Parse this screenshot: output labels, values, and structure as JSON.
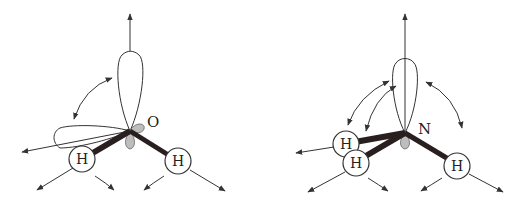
{
  "diagram": {
    "molecules": [
      {
        "name": "water",
        "center_atom": {
          "label": "O"
        },
        "hydrogens": [
          {
            "label": "H"
          },
          {
            "label": "H"
          }
        ],
        "lone_pairs": 2
      },
      {
        "name": "ammonia",
        "center_atom": {
          "label": "N"
        },
        "hydrogens": [
          {
            "label": "H"
          },
          {
            "label": "H"
          },
          {
            "label": "H"
          }
        ],
        "lone_pairs": 1
      }
    ],
    "colors": {
      "line": "#333333",
      "bond": "#2a1f1f",
      "lobe_fill": "#ffffff",
      "small_lobe_fill": "#b8b8b8"
    }
  }
}
